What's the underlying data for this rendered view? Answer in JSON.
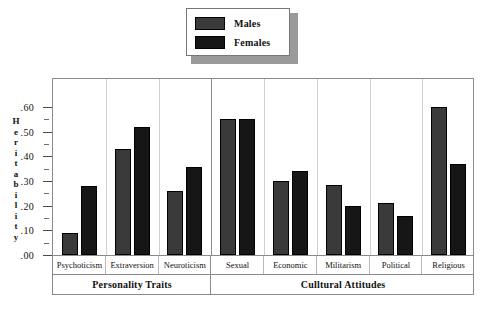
{
  "legend": {
    "items": [
      {
        "label": "Males",
        "color": "#3a3a3a"
      },
      {
        "label": "Females",
        "color": "#161616"
      }
    ]
  },
  "axis": {
    "y_title_chars": [
      "H",
      "e",
      "r",
      "i",
      "t",
      "a",
      "b",
      "i",
      "l",
      "i",
      "t",
      "y"
    ],
    "y_title": "Heritability",
    "y_ticks": [
      ".00",
      ".10",
      ".20",
      ".30",
      ".40",
      ".50",
      ".60"
    ]
  },
  "sections": [
    {
      "label": "Personality Traits",
      "count": 3
    },
    {
      "label": "Culltural Attitudes",
      "count": 5
    }
  ],
  "chart_data": {
    "type": "bar",
    "title": "",
    "xlabel": "",
    "ylabel": "Heritability",
    "ylim": [
      0.0,
      0.65
    ],
    "ytick_values": [
      0.0,
      0.1,
      0.2,
      0.3,
      0.4,
      0.5,
      0.6
    ],
    "grid": false,
    "legend_position": "top-center",
    "categories": [
      "Psychoticism",
      "Extraversion",
      "Neuroticism",
      "Sexual",
      "Economic",
      "Militarism",
      "Political",
      "Religious"
    ],
    "category_sections": [
      "Personality Traits",
      "Personality Traits",
      "Personality Traits",
      "Culltural Attitudes",
      "Culltural Attitudes",
      "Culltural Attitudes",
      "Culltural Attitudes",
      "Culltural Attitudes"
    ],
    "series": [
      {
        "name": "Males",
        "color": "#3a3a3a",
        "values": [
          0.09,
          0.43,
          0.26,
          0.55,
          0.3,
          0.285,
          0.21,
          0.6
        ]
      },
      {
        "name": "Females",
        "color": "#161616",
        "values": [
          0.28,
          0.52,
          0.355,
          0.55,
          0.34,
          0.2,
          0.16,
          0.37
        ]
      }
    ]
  }
}
